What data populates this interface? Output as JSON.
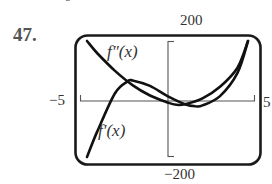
{
  "problem_number": "47.",
  "stray_mark": "6",
  "chart_data": {
    "type": "line",
    "title": "",
    "xlabel": "",
    "ylabel": "",
    "xlim": [
      -5,
      5
    ],
    "ylim": [
      -200,
      200
    ],
    "tick_labels": {
      "x_min": "−5",
      "x_max": "5",
      "y_max": "200",
      "y_min": "−200"
    },
    "grid": false,
    "legend": "inline curve labels",
    "series": [
      {
        "name": "f''(x)",
        "label": "f″(x)",
        "points": [
          [
            -4.6,
            200
          ],
          [
            -4,
            157
          ],
          [
            -3,
            97
          ],
          [
            -2,
            48
          ],
          [
            -1,
            12
          ],
          [
            0,
            -12
          ],
          [
            0.5,
            -20
          ],
          [
            1,
            -18
          ],
          [
            2,
            2
          ],
          [
            3,
            42
          ],
          [
            4,
            108
          ],
          [
            4.6,
            200
          ]
        ]
      },
      {
        "name": "f'(x)",
        "label": "f′(x)",
        "points": [
          [
            -4.6,
            -200
          ],
          [
            -4,
            -110
          ],
          [
            -3,
            20
          ],
          [
            -2.3,
            60
          ],
          [
            -2,
            64
          ],
          [
            -1,
            45
          ],
          [
            0,
            10
          ],
          [
            1,
            -18
          ],
          [
            1.6,
            -25
          ],
          [
            2,
            -22
          ],
          [
            3,
            10
          ],
          [
            4,
            90
          ],
          [
            4.6,
            200
          ]
        ]
      }
    ]
  }
}
